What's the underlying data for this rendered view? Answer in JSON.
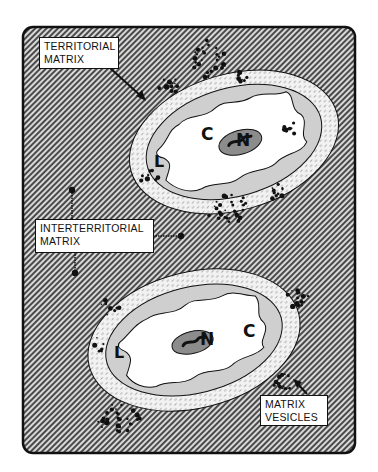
{
  "figure": {
    "labels": {
      "territorial_matrix": [
        "TERRITORIAL",
        "MATRIX"
      ],
      "interterritorial_matrix": [
        "INTERTERRITORIAL",
        "MATRIX"
      ],
      "matrix_vesicles": [
        "MATRIX",
        "VESICLES"
      ]
    },
    "cells": [
      {
        "name": "upper-chondrocyte",
        "letters": {
          "cytoplasm": "C",
          "nucleus": "N",
          "lacuna": "L"
        }
      },
      {
        "name": "lower-chondrocyte",
        "letters": {
          "cytoplasm": "C",
          "nucleus": "N",
          "lacuna": "L"
        }
      }
    ],
    "colors": {
      "background_hatch_light": "#d8d8d8",
      "background_hatch_dark": "#4a4a4a",
      "territorial_rim": "#ececec",
      "lacuna": "#cfcfcf",
      "cytoplasm": "#ffffff",
      "nucleus": "#8c8c8c",
      "outline": "#111111"
    }
  }
}
